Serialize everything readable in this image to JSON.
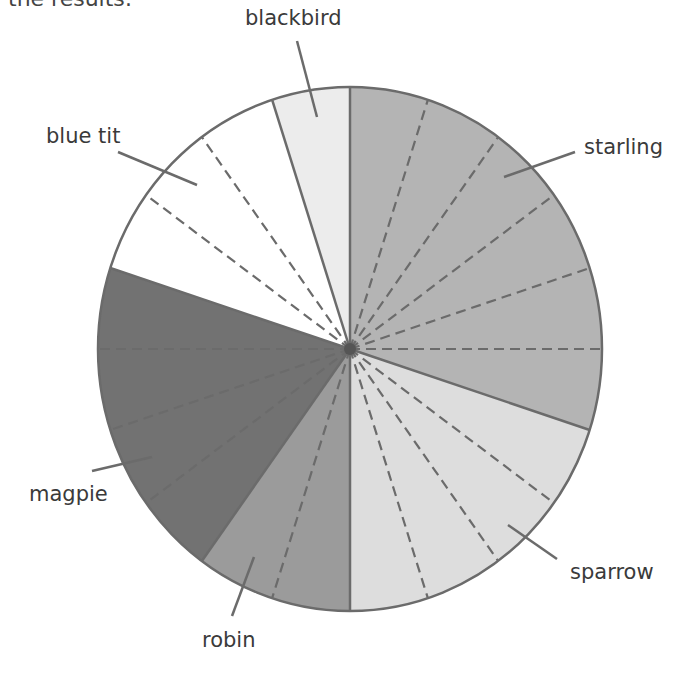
{
  "intro_text": "the results:",
  "chart_data": {
    "type": "pie",
    "title": "",
    "total_units": 20,
    "unit_angle_deg": 18,
    "start_angle_deg": 0,
    "direction": "clockwise",
    "categories": [
      "starling",
      "sparrow",
      "robin",
      "magpie",
      "blue tit",
      "blackbird"
    ],
    "values": [
      6,
      4,
      2,
      4,
      3,
      1
    ],
    "colors": [
      "#b4b4b4",
      "#dddddd",
      "#9b9b9b",
      "#727272",
      "#ffffff",
      "#ececec"
    ],
    "outline_color": "#6b6b6b",
    "divider_style": "dashed lines mark each individual unit within a slice",
    "legend": "none (leader-line labels)"
  },
  "labels": {
    "starling": "starling",
    "sparrow": "sparrow",
    "robin": "robin",
    "magpie": "magpie",
    "blue_tit": "blue tit",
    "blackbird": "blackbird"
  }
}
